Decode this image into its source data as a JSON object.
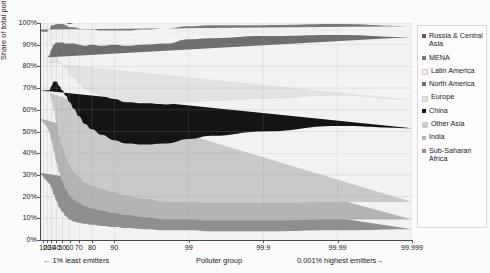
{
  "chart_data": {
    "type": "area",
    "title": "",
    "xlabel": "Polluter group",
    "ylabel": "Share of total pollution (%)",
    "ylim": [
      0,
      100
    ],
    "grid": true,
    "legend_position": "right",
    "xtick_labels": [
      "10",
      "20",
      "30",
      "40",
      "50",
      "60",
      "70",
      "80",
      "90",
      "99",
      "99.9",
      "99.99",
      "99.999"
    ],
    "xtick_positions": [
      10,
      20,
      30,
      40,
      50,
      60,
      70,
      80,
      90,
      99,
      99.9,
      99.99,
      99.999
    ],
    "ytick_labels": [
      "0%",
      "10%",
      "20%",
      "30%",
      "40%",
      "50%",
      "60%",
      "70%",
      "80%",
      "90%",
      "100%"
    ],
    "ytick_values": [
      0,
      10,
      20,
      30,
      40,
      50,
      60,
      70,
      80,
      90,
      100
    ],
    "annotations": {
      "left": "← 1% least emitters",
      "middle": "Polluter group",
      "right": "0.001% highest emitters→"
    },
    "x": [
      0,
      5,
      10,
      15,
      20,
      25,
      30,
      35,
      40,
      45,
      50,
      55,
      60,
      65,
      70,
      75,
      80,
      85,
      90,
      93,
      96,
      98,
      99,
      99.5,
      99.9,
      99.99,
      99.999,
      100
    ],
    "series": [
      {
        "name": "Sub-Saharan Africa",
        "color": "#8f8f8f",
        "values": [
          31,
          30,
          29,
          28,
          27,
          26,
          24,
          21,
          18,
          15,
          13,
          11,
          9.5,
          8.5,
          8,
          7.5,
          7,
          6.5,
          6,
          5.5,
          5,
          4.5,
          4.5,
          4,
          4,
          4.5,
          5,
          5
        ]
      },
      {
        "name": "India",
        "color": "#b4b4b4",
        "values": [
          25,
          25,
          25,
          25,
          25,
          24,
          22,
          20,
          18,
          16,
          14,
          12.5,
          11,
          10,
          9,
          8,
          7.5,
          7,
          6.5,
          6,
          5.5,
          5,
          5,
          5,
          5,
          5,
          4.5,
          4.5
        ]
      },
      {
        "name": "Other Asia",
        "color": "#c9c9c9",
        "values": [
          13,
          14,
          15,
          16,
          17,
          18,
          19,
          19,
          18,
          17,
          16,
          15,
          14,
          13,
          12,
          11,
          10.5,
          10,
          9.5,
          9,
          8.5,
          8,
          8,
          8,
          8,
          8,
          8,
          8
        ]
      },
      {
        "name": "China",
        "color": "#141414",
        "values": [
          0,
          0,
          0,
          0,
          0,
          1,
          6,
          13,
          19,
          23,
          26,
          28,
          29,
          29,
          28,
          27,
          26,
          25,
          24,
          24,
          25,
          27,
          29,
          31,
          33,
          35,
          34,
          33
        ]
      },
      {
        "name": "Europe",
        "color": "#e2e2e2",
        "values": [
          13,
          13,
          13,
          13,
          13,
          13,
          13,
          12,
          12,
          12,
          12,
          12,
          13,
          14,
          15,
          16,
          17,
          18,
          19,
          19,
          19,
          18,
          17,
          16,
          15,
          14,
          13,
          13
        ]
      },
      {
        "name": "North America",
        "color": "#6e6e6e",
        "values": [
          2,
          2,
          2,
          2,
          2,
          3,
          4,
          5,
          6,
          8,
          10,
          12,
          14,
          16,
          18,
          20,
          22,
          23,
          25,
          26,
          27,
          28,
          29,
          29,
          29,
          28,
          29,
          30
        ]
      },
      {
        "name": "Latin America",
        "color": "#efefef",
        "values": [
          9,
          8,
          8,
          8,
          8,
          8,
          8,
          7,
          7,
          7,
          7,
          7,
          6,
          6,
          6,
          6,
          5.5,
          5.5,
          5,
          5,
          5,
          5,
          4,
          4,
          3,
          3,
          3,
          3
        ]
      },
      {
        "name": "MENA",
        "color": "#7a7a7a",
        "values": [
          4,
          4,
          4,
          4,
          4,
          4,
          3,
          2,
          1.5,
          1.5,
          1.5,
          1.5,
          1.5,
          1.5,
          1.5,
          1.5,
          1.5,
          1.5,
          1.5,
          2,
          2,
          2,
          2,
          2,
          2,
          2,
          2,
          2
        ]
      },
      {
        "name": "Russia & Central Asia",
        "color": "#5c5c5c",
        "values": [
          3,
          4,
          4,
          4,
          4,
          3,
          1,
          1,
          0.5,
          0.5,
          0.5,
          1,
          1.5,
          2,
          2.5,
          3,
          3,
          3.5,
          3.5,
          3.5,
          3,
          2.5,
          1.5,
          1,
          1,
          0.5,
          1.5,
          1.5
        ]
      }
    ]
  },
  "legend": {
    "items": [
      {
        "label": "Russia & Central Asia",
        "color": "#5c5c5c"
      },
      {
        "label": "MENA",
        "color": "#7a7a7a"
      },
      {
        "label": "Latin America",
        "color": "#efefef"
      },
      {
        "label": "North America",
        "color": "#6e6e6e"
      },
      {
        "label": "Europe",
        "color": "#e2e2e2"
      },
      {
        "label": "China",
        "color": "#141414"
      },
      {
        "label": "Other Asia",
        "color": "#c9c9c9"
      },
      {
        "label": "India",
        "color": "#b4b4b4"
      },
      {
        "label": "Sub-Saharan Africa",
        "color": "#8f8f8f"
      }
    ]
  }
}
